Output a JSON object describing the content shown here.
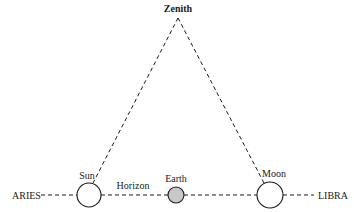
{
  "diagram": {
    "type": "astronomical-geometry",
    "labels": {
      "zenith": "Zenith",
      "sun": "Sun",
      "moon": "Moon",
      "earth": "Earth",
      "horizon": "Horizon",
      "aries": "ARIES",
      "libra": "LIBRA"
    },
    "nodes": [
      {
        "id": "zenith",
        "label": "Zenith",
        "x": 178,
        "y": 17
      },
      {
        "id": "sun",
        "label": "Sun",
        "x": 89,
        "y": 195,
        "r": 12,
        "fill": "#ffffff"
      },
      {
        "id": "earth",
        "label": "Earth",
        "x": 176,
        "y": 195,
        "r": 8,
        "fill": "#c8c8c8"
      },
      {
        "id": "moon",
        "label": "Moon",
        "x": 270,
        "y": 195,
        "r": 13,
        "fill": "#ffffff"
      }
    ],
    "edges": [
      {
        "from": "zenith",
        "to": "sun",
        "style": "dashed"
      },
      {
        "from": "zenith",
        "to": "moon",
        "style": "dashed"
      },
      {
        "from": "aries",
        "to": "libra",
        "style": "dashed",
        "label": "Horizon"
      }
    ],
    "colors": {
      "line": "#1a1a1a",
      "earth_fill": "#c8c8c8",
      "background": "#ffffff"
    }
  }
}
